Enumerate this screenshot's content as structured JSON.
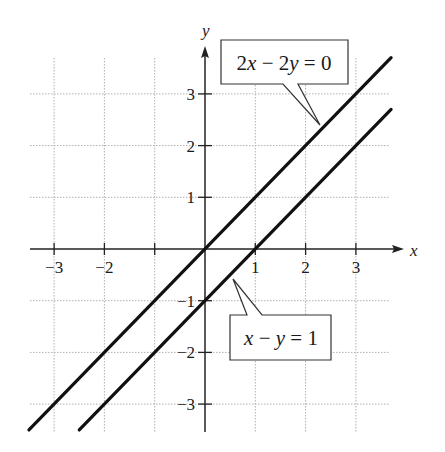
{
  "chart_data": {
    "type": "line",
    "title": "",
    "xlabel": "x",
    "ylabel": "y",
    "xlim": [
      -3.5,
      3.7
    ],
    "ylim": [
      -3.5,
      3.8
    ],
    "grid": true,
    "x_ticks": [
      -3,
      -2,
      -1,
      1,
      2,
      3
    ],
    "x_tick_labels": [
      "−3",
      "−2",
      "",
      "1",
      "2",
      "3"
    ],
    "y_ticks": [
      -3,
      -2,
      -1,
      1,
      2,
      3
    ],
    "y_tick_labels": [
      "−3",
      "−2",
      "−1",
      "1",
      "2",
      "3"
    ],
    "series": [
      {
        "name": "2x − 2y = 0",
        "equation": "y = x",
        "x": [
          -3.5,
          3.7
        ],
        "y": [
          -3.5,
          3.7
        ]
      },
      {
        "name": "x − y = 1",
        "equation": "y = x − 1",
        "x": [
          -2.5,
          3.7
        ],
        "y": [
          -3.5,
          2.7
        ]
      }
    ],
    "annotations": [
      {
        "text": "2x − 2y = 0",
        "points_to": [
          2.3,
          2.3
        ]
      },
      {
        "text": "x − y = 1",
        "points_to": [
          0.55,
          -0.45
        ]
      }
    ]
  },
  "labels": {
    "x_axis": "x",
    "y_axis": "y",
    "callout_1": {
      "parts": [
        "2",
        "x",
        " − 2",
        "y",
        " = 0"
      ]
    },
    "callout_2": {
      "parts": [
        "x",
        " − ",
        "y",
        " = 1"
      ]
    }
  },
  "colors": {
    "line": "#111111",
    "grid": "#b0b0b0",
    "axis": "#222222",
    "callout_border": "#333333"
  }
}
